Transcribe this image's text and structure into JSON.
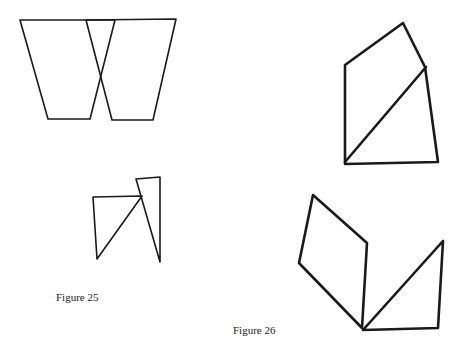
{
  "figures": [
    {
      "id": "figure-25",
      "caption": "Figure 25",
      "caption_pos": {
        "x": 56,
        "y": 291
      },
      "stroke_color": "#1a1a1a",
      "shapes": [
        {
          "name": "left-trapezoid",
          "points": [
            [
              20,
              20
            ],
            [
              115,
              20
            ],
            [
              90,
              119
            ],
            [
              48,
              119
            ]
          ]
        },
        {
          "name": "right-trapezoid",
          "points": [
            [
              86,
              20
            ],
            [
              176,
              19
            ],
            [
              153,
              120
            ],
            [
              112,
              120
            ]
          ]
        },
        {
          "name": "left-small-triangle",
          "points": [
            [
              93,
              197
            ],
            [
              142,
              196
            ],
            [
              97,
              259
            ]
          ]
        },
        {
          "name": "right-tall-triangle",
          "points": [
            [
              136,
              179
            ],
            [
              160,
              177
            ],
            [
              160,
              262
            ]
          ]
        }
      ]
    },
    {
      "id": "figure-26",
      "caption": "Figure 26",
      "caption_pos": {
        "x": 233,
        "y": 324
      },
      "stroke_color": "#1a1a1a",
      "shapes": [
        {
          "name": "upper-pentagon",
          "points": [
            [
              345,
              65
            ],
            [
              403,
              23
            ],
            [
              425,
              67
            ],
            [
              438,
              162
            ],
            [
              345,
              164
            ]
          ]
        },
        {
          "name": "upper-diagonal",
          "points": [
            [
              345,
              162
            ],
            [
              426,
              67
            ]
          ],
          "open": true
        },
        {
          "name": "lower-parallelogram",
          "points": [
            [
              313,
              195
            ],
            [
              367,
              243
            ],
            [
              362,
              328
            ],
            [
              299,
              263
            ]
          ]
        },
        {
          "name": "lower-triangle",
          "points": [
            [
              363,
              330
            ],
            [
              443,
              241
            ],
            [
              438,
              328
            ]
          ]
        }
      ]
    }
  ]
}
